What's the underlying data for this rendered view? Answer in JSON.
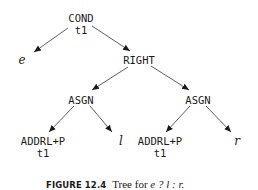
{
  "figure": {
    "caption": {
      "label": "FIGURE 12.4",
      "text": "Tree for ",
      "expression": "e ? l : r."
    },
    "tree": {
      "root": {
        "op": "COND",
        "reg": "t1"
      },
      "left_leaf": "e",
      "right": {
        "op": "RIGHT"
      },
      "asgn_left": {
        "op": "ASGN"
      },
      "asgn_right": {
        "op": "ASGN"
      },
      "addr_left": {
        "op": "ADDRL+P",
        "reg": "t1"
      },
      "addr_right": {
        "op": "ADDRL+P",
        "reg": "t1"
      },
      "leaf_l": "l",
      "leaf_r": "r"
    },
    "edges": [
      [
        "COND",
        "e"
      ],
      [
        "COND",
        "RIGHT"
      ],
      [
        "RIGHT",
        "ASGN_left"
      ],
      [
        "RIGHT",
        "ASGN_right"
      ],
      [
        "ASGN_left",
        "ADDRL+P_left"
      ],
      [
        "ASGN_left",
        "l"
      ],
      [
        "ASGN_right",
        "ADDRL+P_right"
      ],
      [
        "ASGN_right",
        "r"
      ]
    ],
    "colors": {
      "ink": "#1a1a1a",
      "background": "#ffffff"
    }
  }
}
